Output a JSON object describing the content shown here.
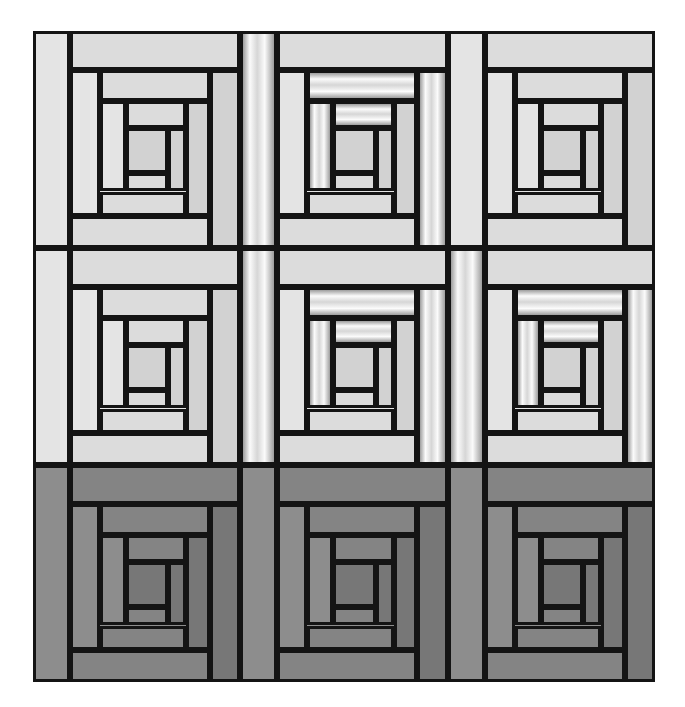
{
  "artwork": {
    "title": "Log Cabin Quilt Grid",
    "kind": "geometric-pattern",
    "background_color": "#ffffff",
    "outline_color": "#141414",
    "outline_width_px": 3
  },
  "canvas": {
    "width": 685,
    "height": 707
  },
  "grid": {
    "rows": 3,
    "columns": 3,
    "origin_x": 33,
    "origin_y": 31,
    "width": 622,
    "height": 651,
    "cell_width": 207,
    "cell_height": 217,
    "gap": 0
  },
  "palette": {
    "light_fill": "#e4e4e4",
    "light_fill_alt": "#dcdcdc",
    "light_fill_deep": "#d2d2d2",
    "dark_fill": "#8d8d8d",
    "dark_fill_alt": "#848484",
    "dark_fill_deep": "#777777",
    "gradient_highlight": "#fbfbfb",
    "gradient_mid": "#d6d6d6",
    "gradient_shadow": "#9d9d9d",
    "outline": "#141414",
    "paper": "#ffffff"
  },
  "log_layout": {
    "description": "Nested clockwise log-cabin spiral; each ring peels a log off one side of the remaining rectangle.",
    "ring_fractions": [
      0.178,
      0.178,
      0.178,
      0.178,
      0.215,
      0.215,
      0.215,
      0.215,
      0.3,
      0.3,
      0.3,
      0.3
    ],
    "ring_count": 12
  },
  "blocks": [
    {
      "id": "block-r1c1",
      "row": 1,
      "column": 1,
      "tone": "light",
      "orientation": "spiral-clockwise",
      "base_fill": "#e4e4e4",
      "gradient_logs": []
    },
    {
      "id": "block-r1c2",
      "row": 1,
      "column": 2,
      "tone": "light",
      "orientation": "spiral-clockwise",
      "base_fill": "#e4e4e4",
      "gradient_logs": [
        0,
        2,
        5,
        8,
        9
      ]
    },
    {
      "id": "block-r1c3",
      "row": 1,
      "column": 3,
      "tone": "light",
      "orientation": "spiral-clockwise",
      "base_fill": "#e4e4e4",
      "gradient_logs": []
    },
    {
      "id": "block-r2c1",
      "row": 2,
      "column": 1,
      "tone": "light",
      "orientation": "spiral-clockwise",
      "base_fill": "#e4e4e4",
      "gradient_logs": []
    },
    {
      "id": "block-r2c2",
      "row": 2,
      "column": 2,
      "tone": "light",
      "orientation": "spiral-clockwise",
      "base_fill": "#e4e4e4",
      "gradient_logs": [
        0,
        2,
        5,
        8,
        9
      ]
    },
    {
      "id": "block-r2c3",
      "row": 2,
      "column": 3,
      "tone": "light",
      "orientation": "spiral-clockwise",
      "base_fill": "#e4e4e4",
      "gradient_logs": [
        0,
        2,
        5,
        8,
        9
      ]
    },
    {
      "id": "block-r3c1",
      "row": 3,
      "column": 1,
      "tone": "dark",
      "orientation": "spiral-clockwise",
      "base_fill": "#8d8d8d",
      "gradient_logs": []
    },
    {
      "id": "block-r3c2",
      "row": 3,
      "column": 2,
      "tone": "dark",
      "orientation": "spiral-clockwise",
      "base_fill": "#8d8d8d",
      "gradient_logs": []
    },
    {
      "id": "block-r3c3",
      "row": 3,
      "column": 3,
      "tone": "dark",
      "orientation": "spiral-clockwise",
      "base_fill": "#8d8d8d",
      "gradient_logs": []
    }
  ]
}
